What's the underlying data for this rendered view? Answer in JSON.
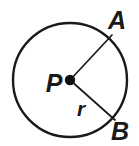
{
  "figure": {
    "type": "geometry-diagram",
    "background_color": "#ffffff",
    "ink_color": "#1a1a1a",
    "width": 139,
    "height": 146,
    "circle": {
      "name": "circle-P",
      "center_label": "P",
      "center_x": 70,
      "center_y": 80,
      "radius": 57,
      "stroke_width": 2.4,
      "fill": "#ffffff"
    },
    "center_point": {
      "name": "point-P",
      "x": 70,
      "y": 80,
      "dot_radius": 5.2,
      "fill": "#111111"
    },
    "radii": [
      {
        "name": "radius-PA",
        "from_label": "P",
        "to_label": "A",
        "x1": 70,
        "y1": 80,
        "x2": 112,
        "y2": 35,
        "measure_label": ""
      },
      {
        "name": "radius-PB",
        "from_label": "P",
        "to_label": "B",
        "x1": 70,
        "y1": 80,
        "x2": 115,
        "y2": 120,
        "measure_label": "r"
      }
    ],
    "labels": {
      "center": {
        "text": "P",
        "x": 48,
        "y": 92
      },
      "point_a": {
        "text": "A",
        "x": 108,
        "y": 29
      },
      "point_b": {
        "text": "B",
        "x": 112,
        "y": 140
      },
      "radius_measure": {
        "text": "r",
        "x": 75,
        "y": 116
      }
    }
  }
}
